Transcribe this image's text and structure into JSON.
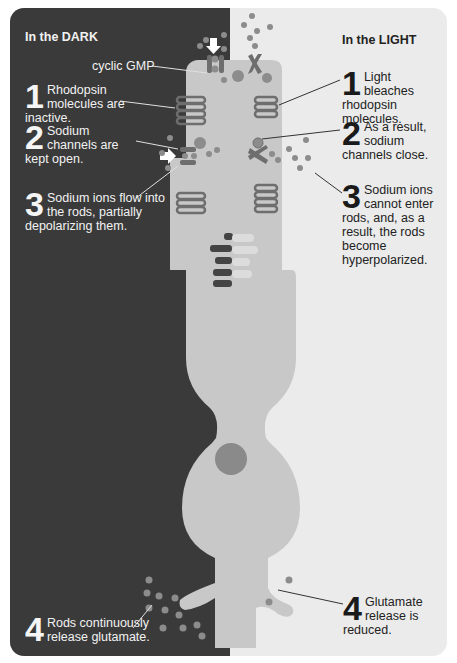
{
  "dark": {
    "heading": "In the DARK",
    "cgmp_label": "cyclic GMP",
    "steps": [
      {
        "num": "1",
        "text": "Rhodopsin molecules are inactive."
      },
      {
        "num": "2",
        "text": "Sodium channels are kept open."
      },
      {
        "num": "3",
        "text": "Sodium ions flow into the rods, partially depolarizing them."
      },
      {
        "num": "4",
        "text": "Rods continuously release glutamate."
      }
    ]
  },
  "light": {
    "heading": "In the LIGHT",
    "steps": [
      {
        "num": "1",
        "text": "Light bleaches rhodopsin molecules."
      },
      {
        "num": "2",
        "text": "As a result, sodium channels close."
      },
      {
        "num": "3",
        "text": "Sodium ions cannot enter rods, and, as a result, the rods become hyperpolarized."
      },
      {
        "num": "4",
        "text": "Glutamate release is reduced."
      }
    ]
  },
  "colors": {
    "dark_bg": "#3a3a3a",
    "light_bg": "#ebebeb",
    "rod_fill": "#c8c8c8",
    "disc": "#6e6e6e",
    "ion": "#8c8c8c",
    "nucleus": "#8a8a8a"
  }
}
